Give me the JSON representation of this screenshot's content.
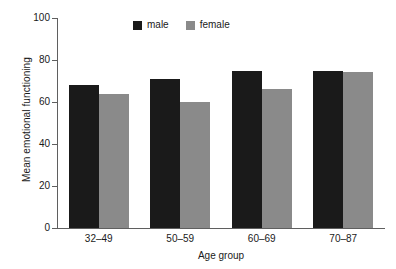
{
  "chart_data": {
    "type": "bar",
    "title": "",
    "subtitle": "",
    "xlabel": "Age group",
    "ylabel": "Mean emotional functioning",
    "categories": [
      "32–49",
      "50–59",
      "60–69",
      "70–87"
    ],
    "series": [
      {
        "name": "male",
        "color": "#1a1a1a",
        "values": [
          68,
          71,
          75,
          75
        ]
      },
      {
        "name": "female",
        "color": "#8a8a8a",
        "values": [
          64,
          60,
          66,
          74.5
        ]
      }
    ],
    "ylim": [
      0,
      100
    ],
    "yticks": [
      0,
      20,
      40,
      60,
      80,
      100
    ],
    "ytick_labels": [
      "0",
      "20",
      "40",
      "60",
      "80",
      "100"
    ],
    "grid": false,
    "legend": {
      "position": "top-center",
      "entries": [
        {
          "label": "male",
          "color": "#1a1a1a"
        },
        {
          "label": "female",
          "color": "#8a8a8a"
        }
      ]
    },
    "axis_color": "#5f5f5f",
    "background": "#ffffff"
  }
}
